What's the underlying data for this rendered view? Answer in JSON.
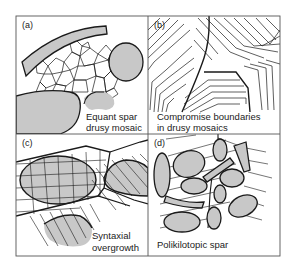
{
  "figure": {
    "panels": [
      {
        "id": "a",
        "tag": "(a)",
        "caption_lines": [
          "Equant spar",
          "drusy mosaic"
        ]
      },
      {
        "id": "b",
        "tag": "(b)",
        "caption_lines": [
          "Compromise boundaries",
          "in drusy mosaics"
        ]
      },
      {
        "id": "c",
        "tag": "(c)",
        "caption_lines": [
          "Syntaxial",
          "overgrowth"
        ]
      },
      {
        "id": "d",
        "tag": "(d)",
        "caption_lines": [
          "Polikilotopic spar"
        ]
      }
    ],
    "colors": {
      "frame": "#555555",
      "line": "#1a1a1a",
      "grain_fill": "#c8c8c8",
      "background": "#ffffff"
    }
  }
}
